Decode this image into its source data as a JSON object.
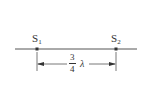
{
  "diagram": {
    "sources": [
      {
        "name": "S",
        "subscript": "1"
      },
      {
        "name": "S",
        "subscript": "2"
      }
    ],
    "distance": {
      "numerator": "3",
      "denominator": "4",
      "symbol": "λ"
    },
    "colors": {
      "line": "#555555",
      "dot": "#333333"
    }
  }
}
